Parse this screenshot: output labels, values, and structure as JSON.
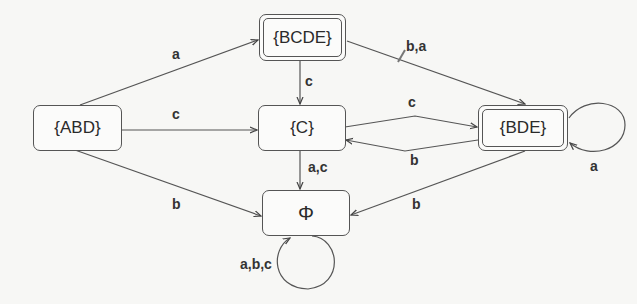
{
  "diagram": {
    "type": "dfa-state-diagram",
    "nodes": [
      {
        "id": "ABD",
        "label": "{ABD}",
        "accepting": false
      },
      {
        "id": "BCDE",
        "label": "{BCDE}",
        "accepting": true
      },
      {
        "id": "C",
        "label": "{C}",
        "accepting": false
      },
      {
        "id": "BDE",
        "label": "{BDE}",
        "accepting": true
      },
      {
        "id": "PHI",
        "label": "Φ",
        "accepting": false
      }
    ],
    "edges": [
      {
        "from": "ABD",
        "to": "BCDE",
        "label": "a"
      },
      {
        "from": "ABD",
        "to": "C",
        "label": "c"
      },
      {
        "from": "ABD",
        "to": "PHI",
        "label": "b"
      },
      {
        "from": "BCDE",
        "to": "C",
        "label": "c"
      },
      {
        "from": "BCDE",
        "to": "BDE",
        "label": "b,a"
      },
      {
        "from": "C",
        "to": "BDE",
        "label": "c"
      },
      {
        "from": "BDE",
        "to": "C",
        "label": "b"
      },
      {
        "from": "C",
        "to": "PHI",
        "label": "a,c"
      },
      {
        "from": "BDE",
        "to": "PHI",
        "label": "b"
      },
      {
        "from": "BDE",
        "to": "BDE",
        "label": "a"
      },
      {
        "from": "PHI",
        "to": "PHI",
        "label": "a,b,c"
      }
    ]
  }
}
